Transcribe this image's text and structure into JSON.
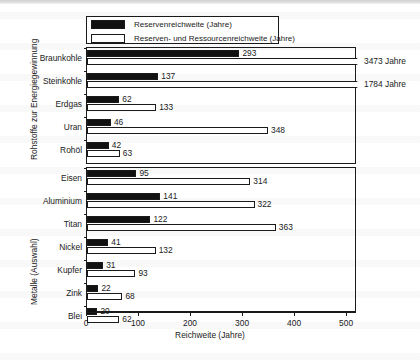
{
  "chart_data": {
    "type": "bar",
    "orientation": "horizontal",
    "title": "",
    "xlabel": "Reichweite (Jahre)",
    "ylabel": "",
    "xlim": [
      0,
      519
    ],
    "xticks": [
      0,
      100,
      200,
      300,
      400,
      500
    ],
    "xticklabels": [
      "0",
      "100",
      "200",
      "300",
      "400",
      "500"
    ],
    "grid": false,
    "legend_position": "top-left",
    "legend": [
      {
        "key": "reserve",
        "label": "Reservenreichweite (Jahre)",
        "color": "#111111",
        "fill": "solid"
      },
      {
        "key": "resource",
        "label": "Reserven- und Ressourcenreichweite (Jahre)",
        "color": "#ffffff",
        "fill": "hollow"
      }
    ],
    "series": [
      {
        "name": "Reservenreichweite (Jahre)",
        "values": [
          293,
          137,
          62,
          46,
          42,
          95,
          141,
          122,
          41,
          31,
          22,
          20
        ]
      },
      {
        "name": "Reserven- und Ressourcenreichweite (Jahre)",
        "values": [
          3473,
          1784,
          133,
          348,
          63,
          314,
          322,
          363,
          132,
          93,
          68,
          62
        ]
      }
    ],
    "categories": [
      "Braunkohle",
      "Steinkohle",
      "Erdgas",
      "Uran",
      "Rohöl",
      "Eisen",
      "Aluminium",
      "Titan",
      "Nickel",
      "Kupfer",
      "Zink",
      "Blei"
    ],
    "panels": [
      {
        "id": "energy",
        "axis_title": "Rohstoffe zur Energiegewinnung",
        "categories": [
          {
            "label": "Braunkohle",
            "reserve": 293,
            "resource": 3473,
            "resource_broken": true,
            "resource_note": "3473 Jahre"
          },
          {
            "label": "Steinkohle",
            "reserve": 137,
            "resource": 1784,
            "resource_broken": true,
            "resource_note": "1784 Jahre"
          },
          {
            "label": "Erdgas",
            "reserve": 62,
            "resource": 133,
            "resource_broken": false,
            "resource_note": ""
          },
          {
            "label": "Uran",
            "reserve": 46,
            "resource": 348,
            "resource_broken": false,
            "resource_note": ""
          },
          {
            "label": "Rohöl",
            "reserve": 42,
            "resource": 63,
            "resource_broken": false,
            "resource_note": ""
          }
        ]
      },
      {
        "id": "metals",
        "axis_title": "Metalle (Auswahl)",
        "categories": [
          {
            "label": "Eisen",
            "reserve": 95,
            "resource": 314,
            "resource_broken": false,
            "resource_note": ""
          },
          {
            "label": "Aluminium",
            "reserve": 141,
            "resource": 322,
            "resource_broken": false,
            "resource_note": ""
          },
          {
            "label": "Titan",
            "reserve": 122,
            "resource": 363,
            "resource_broken": false,
            "resource_note": ""
          },
          {
            "label": "Nickel",
            "reserve": 41,
            "resource": 132,
            "resource_broken": false,
            "resource_note": ""
          },
          {
            "label": "Kupfer",
            "reserve": 31,
            "resource": 93,
            "resource_broken": false,
            "resource_note": ""
          },
          {
            "label": "Zink",
            "reserve": 22,
            "resource": 68,
            "resource_broken": false,
            "resource_note": ""
          },
          {
            "label": "Blei",
            "reserve": 20,
            "resource": 62,
            "resource_broken": false,
            "resource_note": ""
          }
        ]
      }
    ]
  }
}
